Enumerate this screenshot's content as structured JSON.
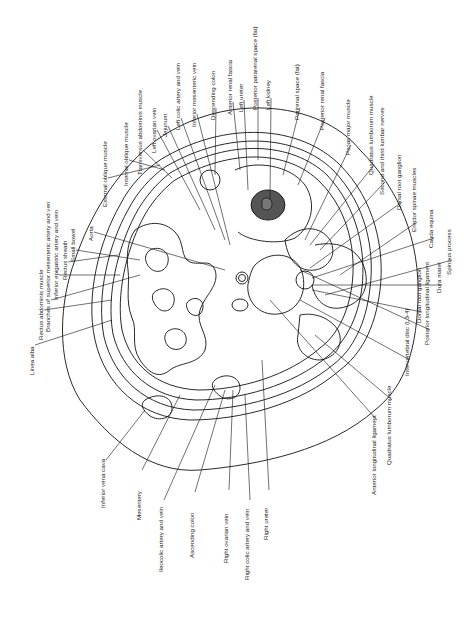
{
  "diagram": {
    "colors": {
      "line": "#111111",
      "kidney_fill": "#555555",
      "background": "#ffffff"
    },
    "labels": [
      {
        "id": "linea-alba",
        "text": "Linea alba",
        "x": 33,
        "y": 375
      },
      {
        "id": "rectus-abdominis",
        "text": "Rectus abdominis muscle",
        "x": 42,
        "y": 340
      },
      {
        "id": "branches-sma",
        "text": "Branches of superior mesenteric artery and ven",
        "x": 49,
        "y": 332
      },
      {
        "id": "inferior-epigastric",
        "text": "Inferior epigastric artery and vein",
        "x": 57,
        "y": 300
      },
      {
        "id": "rectus-sheath",
        "text": "Rectus sheath",
        "x": 66,
        "y": 280
      },
      {
        "id": "small-bowel",
        "text": "Small bowel",
        "x": 74,
        "y": 262
      },
      {
        "id": "aorta",
        "text": "Aorta",
        "x": 92,
        "y": 241
      },
      {
        "id": "external-oblique",
        "text": "External oblique muscle",
        "x": 106,
        "y": 207
      },
      {
        "id": "internal-oblique",
        "text": "Internal oblique muscle",
        "x": 127,
        "y": 186
      },
      {
        "id": "transversus-abdominis",
        "text": "Transversus abdominis muscle",
        "x": 141,
        "y": 175
      },
      {
        "id": "left-ovarian-vein",
        "text": "Left ovarian vein",
        "x": 155,
        "y": 153
      },
      {
        "id": "jejunum",
        "text": "Jejunum",
        "x": 166,
        "y": 137
      },
      {
        "id": "left-colic",
        "text": "Left colic artery and vein",
        "x": 179,
        "y": 130
      },
      {
        "id": "inferior-mesenteric-vein",
        "text": "Inferior mesenteric vein",
        "x": 195,
        "y": 127
      },
      {
        "id": "descending-colon",
        "text": "Descending colon",
        "x": 214,
        "y": 120
      },
      {
        "id": "anterior-renal-fascia",
        "text": "Anterior renal fascia",
        "x": 231,
        "y": 115
      },
      {
        "id": "left-ureter",
        "text": "Left ureter",
        "x": 242,
        "y": 112
      },
      {
        "id": "posterior-pararenal",
        "text": "Posterior pararenal space (fat)",
        "x": 256,
        "y": 110
      },
      {
        "id": "left-kidney",
        "text": "Left kidney",
        "x:": 0,
        "x": 269,
        "y": 110
      },
      {
        "id": "perirenal-space",
        "text": "Perirenal space (fat)",
        "x": 298,
        "y": 120
      },
      {
        "id": "posterior-renal-fascia",
        "text": "Posterior renal fascia",
        "x": 323,
        "y": 130
      },
      {
        "id": "psoas-major",
        "text": "Psoas major muscle",
        "x": 349,
        "y": 155
      },
      {
        "id": "quadratus-lumborum-top",
        "text": "Quadratus lumborum muscle",
        "x": 372,
        "y": 175
      },
      {
        "id": "second-third-lumbar-nerves",
        "text": "Second and third lumbar nerves",
        "x": 383,
        "y": 195
      },
      {
        "id": "dorsal-root-ganglion-top",
        "text": "Dorsal root ganglion",
        "x": 400,
        "y": 210
      },
      {
        "id": "erector-spinae",
        "text": "Erector spinae muscles",
        "x": 415,
        "y": 232
      },
      {
        "id": "cauda-equina",
        "text": "Cauda equina",
        "x": 432,
        "y": 248
      },
      {
        "id": "spinous-process",
        "text": "Spinous process",
        "x": 450,
        "y": 275
      },
      {
        "id": "dura-mater",
        "text": "Dura mater",
        "x": 440,
        "y": 293
      },
      {
        "id": "dorsal-root-ganglion-bottom",
        "text": "Dorsal root ganglion",
        "x": 420,
        "y": 323
      },
      {
        "id": "posterior-longitudinal",
        "text": "Posterior longitudinal ligament",
        "x": 428,
        "y": 345
      },
      {
        "id": "intervertebral-disc",
        "text": "Intervertebral disc (L3-4)",
        "x": 408,
        "y": 376
      },
      {
        "id": "quadratus-lumborum-bottom",
        "text": "Quadratus lumborum muscle",
        "x": 390,
        "y": 465
      },
      {
        "id": "anterior-longitudinal",
        "text": "Anterior longitudinal ligament",
        "x": 375,
        "y": 495
      },
      {
        "id": "inferior-vena-cava",
        "text": "Inferior vena cava",
        "x": 104,
        "y": 508
      },
      {
        "id": "mesentery",
        "text": "Mesentery",
        "x": 140,
        "y": 520
      },
      {
        "id": "ileocolic",
        "text": "Ileocolic artery and vein",
        "x": 162,
        "y": 572
      },
      {
        "id": "ascending-colon",
        "text": "Ascending colon",
        "x": 193,
        "y": 558
      },
      {
        "id": "right-ovarian-vein",
        "text": "Right ovarian vein",
        "x": 227,
        "y": 563
      },
      {
        "id": "right-colic",
        "text": "Right colic artery and vein",
        "x": 248,
        "y": 580
      },
      {
        "id": "right-ureter",
        "text": "Right ureter",
        "x": 267,
        "y": 540
      }
    ]
  }
}
